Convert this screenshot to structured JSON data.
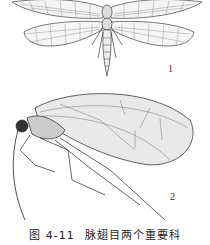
{
  "figure": {
    "caption_number": "图 4-11",
    "caption_text": "脉翅目两个重要科",
    "panels": [
      {
        "label": "1",
        "subject": "lacewing-dorsal-view"
      },
      {
        "label": "2",
        "subject": "lacewing-lateral-view"
      }
    ],
    "colors": {
      "ink": "#1a1a1a",
      "paper": "#ffffff"
    }
  }
}
